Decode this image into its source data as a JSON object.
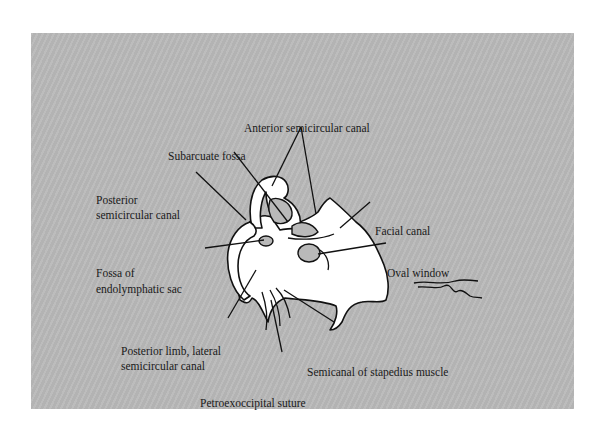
{
  "panel": {
    "background": "#b9b9b9"
  },
  "labels": {
    "anterior_semicircular_canal": "Anterior semicircular canal",
    "subarcuate_fossa": "Subarcuate fossa",
    "posterior_semicircular_canal_line1": "Posterior",
    "posterior_semicircular_canal_line2": "semicircular canal",
    "facial_canal": "Facial canal",
    "fossa_endolymphatic_line1": "Fossa of",
    "fossa_endolymphatic_line2": "endolymphatic sac",
    "oval_window": "Oval window",
    "posterior_limb_line1": "Posterior limb, lateral",
    "posterior_limb_line2": "semicircular canal",
    "semicanal_stapedius": "Semicanal of stapedius muscle",
    "petroexoccipital_suture": "Petroexoccipital suture"
  }
}
